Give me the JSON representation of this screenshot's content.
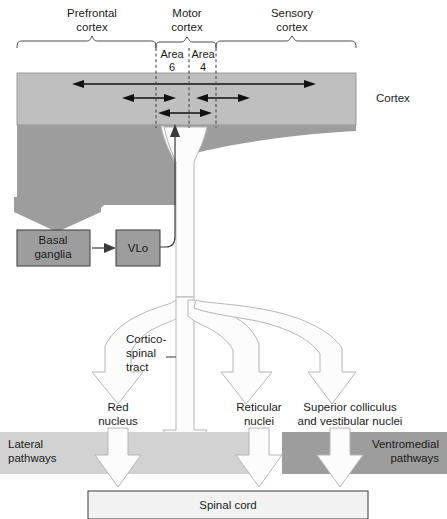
{
  "figure": {
    "type": "diagram"
  },
  "top_regions": [
    {
      "id": "prefrontal",
      "label_line1": "Prefrontal",
      "label_line2": "cortex"
    },
    {
      "id": "motor",
      "label_line1": "Motor",
      "label_line2": "cortex"
    },
    {
      "id": "sensory",
      "label_line1": "Sensory",
      "label_line2": "cortex"
    }
  ],
  "motor_subregions": [
    {
      "id": "area6",
      "label_line1": "Area",
      "label_line2": "6"
    },
    {
      "id": "area4",
      "label_line1": "Area",
      "label_line2": "4"
    }
  ],
  "cortex": {
    "label": "Cortex",
    "band_color": "#bfbfbf",
    "subcortex_color": "#9d9d9d"
  },
  "nuclei_boxes": [
    {
      "id": "basal-ganglia",
      "label_line1": "Basal",
      "label_line2": "ganglia",
      "fill": "#9d9d9d"
    },
    {
      "id": "vlo",
      "label_line1": "VLo",
      "label_line2": "",
      "fill": "#9d9d9d"
    }
  ],
  "tract": {
    "label_line1": "Cortico-",
    "label_line2": "spinal",
    "label_line3": "tract",
    "fill": "#fcfcfc",
    "stroke": "#b6b6b6"
  },
  "targets": [
    {
      "id": "red-nucleus",
      "label_line1": "Red",
      "label_line2": "nucleus"
    },
    {
      "id": "reticular-nuclei",
      "label_line1": "Reticular",
      "label_line2": "nuclei"
    },
    {
      "id": "superior-colliculus",
      "label_line1": "Superior colliculus",
      "label_line2": "and vestibular nuclei"
    }
  ],
  "pathway_bands": [
    {
      "id": "lateral",
      "label_line1": "Lateral",
      "label_line2": "pathways",
      "fill": "#d2d2d2"
    },
    {
      "id": "ventromedial",
      "label_line1": "Ventromedial",
      "label_line2": "pathways",
      "fill": "#9d9d9d"
    }
  ],
  "spinal_cord": {
    "label": "Spinal cord",
    "fill": "#f2f2f2"
  },
  "projection_arrows": [
    {
      "id": "prefrontal-to-sensory",
      "direction": "bidirectional",
      "level": 1
    },
    {
      "id": "prefrontal-to-area6",
      "direction": "bidirectional",
      "level": 2
    },
    {
      "id": "area4-to-sensory",
      "direction": "bidirectional",
      "level": 2
    },
    {
      "id": "area6-to-area4",
      "direction": "bidirectional",
      "level": 3
    }
  ]
}
